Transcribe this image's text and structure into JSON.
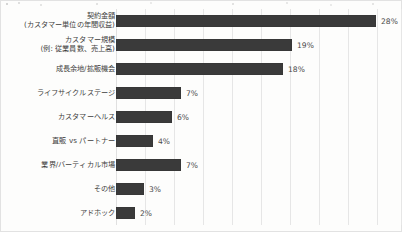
{
  "chart_data": {
    "type": "bar",
    "orientation": "horizontal",
    "title": "",
    "xlabel": "",
    "ylabel": "",
    "xlim": [
      0,
      30
    ],
    "grid": true,
    "gridline_step": 3,
    "legend": "none",
    "value_suffix": "%",
    "bar_color": "#3a3a3a",
    "value_label_color": "#4a4a4a",
    "categories": [
      "契約金額\n(カスタマー単位の年間収益)",
      "カスタマー規模\n(例: 従業員数、売上高)",
      "成長余地/拡販機会",
      "ライフサイクルステージ",
      "カスタマーヘルス",
      "直販 vs パートナー",
      "業界/バーティカル市場",
      "その他",
      "アドホック"
    ],
    "values": [
      28,
      19,
      18,
      7,
      6,
      4,
      7,
      3,
      2
    ],
    "value_labels": [
      "28%",
      "19%",
      "18%",
      "7%",
      "6%",
      "4%",
      "7%",
      "3%",
      "2%"
    ]
  }
}
